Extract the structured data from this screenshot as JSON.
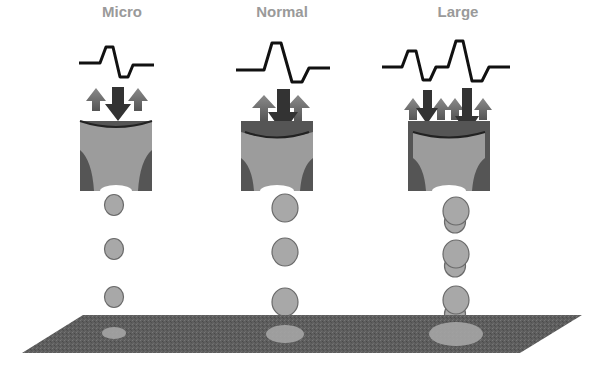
{
  "diagram": {
    "columns": [
      {
        "id": "micro",
        "label": "Micro",
        "droplet_count": 3,
        "droplet_type": "single",
        "pulse_type": "single-pulse-small"
      },
      {
        "id": "normal",
        "label": "Normal",
        "droplet_count": 3,
        "droplet_type": "single",
        "pulse_type": "single-pulse-large"
      },
      {
        "id": "large",
        "label": "Large",
        "droplet_count": 3,
        "droplet_type": "double",
        "pulse_type": "double-pulse"
      }
    ],
    "colors": {
      "waveform": "#111111",
      "label": "#9a9a9a",
      "nozzle_body": "#9c9c9c",
      "nozzle_wall": "#555555",
      "arrow_up": "#6e6e6e",
      "arrow_down": "#333333",
      "droplet": "#a8a8a8",
      "droplet_outline": "#6a6a6a",
      "substrate": "#5e5e5e",
      "dot": "#a5a5a5"
    }
  }
}
